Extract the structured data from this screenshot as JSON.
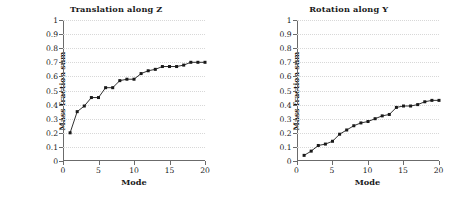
{
  "figure": {
    "panels": [
      "left",
      "right"
    ]
  },
  "chart_data": [
    {
      "type": "line",
      "title": "Translation along Z",
      "xlabel": "Mode",
      "ylabel": "Mass fraction sum",
      "xlim": [
        0,
        20
      ],
      "ylim": [
        0,
        1
      ],
      "xticks": [
        0,
        5,
        10,
        15,
        20
      ],
      "yticks": [
        0,
        0.1,
        0.2,
        0.3,
        0.4,
        0.5,
        0.6,
        0.7,
        0.8,
        0.9,
        1
      ],
      "xticklabels": [
        "0",
        "5",
        "10",
        "15",
        "20"
      ],
      "yticklabels": [
        "0",
        "0.1",
        "0.2",
        "0.3",
        "0.4",
        "0.5",
        "0.6",
        "0.7",
        "0.8",
        "0.9",
        "1"
      ],
      "grid": true,
      "legend": false,
      "marker": "square",
      "color": "#1a1a1a",
      "x": [
        1,
        2,
        3,
        4,
        5,
        6,
        7,
        8,
        9,
        10,
        11,
        12,
        13,
        14,
        15,
        16,
        17,
        18,
        19,
        20
      ],
      "values": [
        0.2,
        0.35,
        0.39,
        0.45,
        0.45,
        0.52,
        0.52,
        0.57,
        0.58,
        0.58,
        0.62,
        0.64,
        0.65,
        0.67,
        0.67,
        0.67,
        0.68,
        0.7,
        0.7,
        0.7
      ]
    },
    {
      "type": "line",
      "title": "Rotation along Y",
      "xlabel": "Mode",
      "ylabel": "Mass fraction sum",
      "xlim": [
        0,
        20
      ],
      "ylim": [
        0,
        1
      ],
      "xticks": [
        0,
        5,
        10,
        15,
        20
      ],
      "yticks": [
        0,
        0.1,
        0.2,
        0.3,
        0.4,
        0.5,
        0.6,
        0.7,
        0.8,
        0.9,
        1
      ],
      "xticklabels": [
        "0",
        "5",
        "10",
        "15",
        "20"
      ],
      "yticklabels": [
        "0",
        "0.1",
        "0.2",
        "0.3",
        "0.4",
        "0.5",
        "0.6",
        "0.7",
        "0.8",
        "0.9",
        "1"
      ],
      "grid": true,
      "legend": false,
      "marker": "square",
      "color": "#1a1a1a",
      "x": [
        1,
        2,
        3,
        4,
        5,
        6,
        7,
        8,
        9,
        10,
        11,
        12,
        13,
        14,
        15,
        16,
        17,
        18,
        19,
        20
      ],
      "values": [
        0.04,
        0.07,
        0.11,
        0.12,
        0.14,
        0.19,
        0.22,
        0.25,
        0.27,
        0.28,
        0.3,
        0.32,
        0.33,
        0.38,
        0.39,
        0.39,
        0.4,
        0.42,
        0.43,
        0.43
      ]
    }
  ]
}
